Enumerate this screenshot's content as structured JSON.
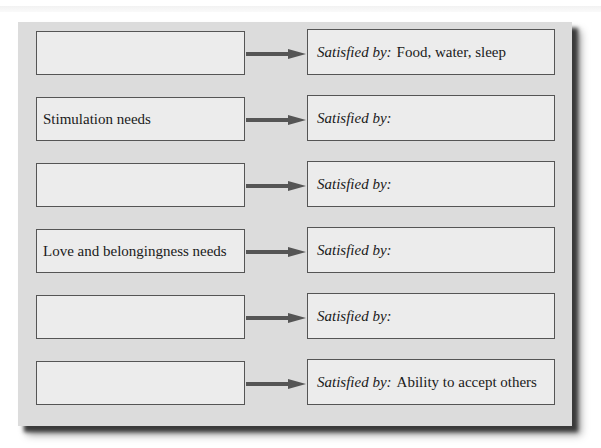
{
  "diagram": {
    "type": "needs-to-satisfiers flow",
    "rows": [
      {
        "need": "",
        "satisfied_label": "Satisfied by:",
        "satisfier": "Food, water, sleep"
      },
      {
        "need": "Stimulation needs",
        "satisfied_label": "Satisfied by:",
        "satisfier": ""
      },
      {
        "need": "",
        "satisfied_label": "Satisfied by:",
        "satisfier": ""
      },
      {
        "need": "Love and belongingness needs",
        "satisfied_label": "Satisfied by:",
        "satisfier": ""
      },
      {
        "need": "",
        "satisfied_label": "Satisfied by:",
        "satisfier": ""
      },
      {
        "need": "",
        "satisfied_label": "Satisfied by:",
        "satisfier": "Ability to accept others"
      }
    ],
    "colors": {
      "panel": "#dcdcdc",
      "box": "#ececec",
      "border": "#555555",
      "arrow": "#555555"
    }
  }
}
